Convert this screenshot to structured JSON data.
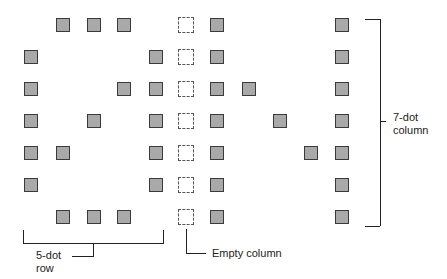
{
  "diagram": {
    "grid": {
      "col_x": [
        31,
        63,
        94,
        124,
        156,
        186,
        217,
        249,
        280,
        311,
        342
      ],
      "row_y": [
        25,
        57,
        89,
        121,
        153,
        185,
        217
      ]
    },
    "filled_dots": [
      [
        0,
        1
      ],
      [
        0,
        2
      ],
      [
        0,
        3
      ],
      [
        1,
        0
      ],
      [
        1,
        4
      ],
      [
        2,
        0
      ],
      [
        2,
        3
      ],
      [
        2,
        4
      ],
      [
        3,
        0
      ],
      [
        3,
        2
      ],
      [
        3,
        4
      ],
      [
        4,
        0
      ],
      [
        4,
        1
      ],
      [
        4,
        4
      ],
      [
        5,
        0
      ],
      [
        5,
        4
      ],
      [
        6,
        1
      ],
      [
        6,
        2
      ],
      [
        6,
        3
      ],
      [
        0,
        6
      ],
      [
        1,
        6
      ],
      [
        2,
        6
      ],
      [
        3,
        6
      ],
      [
        4,
        6
      ],
      [
        5,
        6
      ],
      [
        6,
        6
      ],
      [
        2,
        7
      ],
      [
        3,
        8
      ],
      [
        4,
        9
      ],
      [
        0,
        10
      ],
      [
        1,
        10
      ],
      [
        2,
        10
      ],
      [
        3,
        10
      ],
      [
        4,
        10
      ],
      [
        5,
        10
      ],
      [
        6,
        10
      ]
    ],
    "empty_column_index": 5,
    "labels": {
      "row_label_line1": "5-dot",
      "row_label_line2": "row",
      "empty_column": "Empty column",
      "column_label_line1": "7-dot",
      "column_label_line2": "column"
    }
  }
}
